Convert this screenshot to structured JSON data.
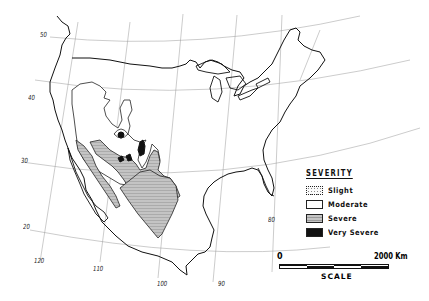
{
  "map": {
    "subject": "Drought severity regions, North America",
    "graticule": {
      "latitude_labels": [
        "50",
        "40",
        "30",
        "20"
      ],
      "longitude_labels": [
        "120",
        "110",
        "100",
        "90",
        "80"
      ]
    }
  },
  "legend": {
    "title": "SEVERITY",
    "items": [
      {
        "label": "Slight",
        "pattern": "dotted",
        "color": "#f2f2f2"
      },
      {
        "label": "Moderate",
        "pattern": "plain",
        "color": "#ffffff"
      },
      {
        "label": "Severe",
        "pattern": "hatched",
        "color": "#b8b8b8"
      },
      {
        "label": "Very Severe",
        "pattern": "solid",
        "color": "#111111"
      }
    ]
  },
  "scale": {
    "start": "0",
    "end": "2000 Km",
    "title": "SCALE"
  }
}
